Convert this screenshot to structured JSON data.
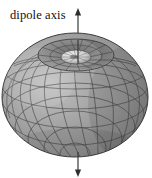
{
  "figure": {
    "title_label": "dipole axis",
    "background_color": "#ffffff",
    "axis": {
      "name": "dipole-axis",
      "color": "#3a3a3a",
      "x": 78,
      "top_y": 10,
      "bottom_y": 176,
      "arrow_up": "▲",
      "arrow_down": "▼",
      "line_width": 1.2
    },
    "surface": {
      "name": "dipole-radiation-pattern",
      "description": "toroidal dipole radiation pattern rendered as a shaded wireframe sphere with a funnel-shaped dimple at the top pole",
      "center_x": 75,
      "center_y": 97,
      "radius_x": 73,
      "radius_y": 62,
      "top_y": 33,
      "bottom_y": 157,
      "left_x": 2,
      "right_x": 148,
      "fill_light": "#b4b4b4",
      "fill_mid": "#9a9a9a",
      "fill_dark": "#7d7d7d",
      "fill_darkest": "#6a6a6a",
      "mesh_color": "#4a4a4a",
      "mesh_width": 0.7,
      "outline_color": "#3d3d3d",
      "meridian_count": 16,
      "parallel_count": 9,
      "dimple": {
        "name": "top-pole-dimple",
        "center_x": 76,
        "center_y": 55,
        "outer_rx": 38,
        "outer_ry": 16,
        "inner_rx": 15,
        "inner_ry": 7,
        "inner_fill": "#dedede",
        "shadow_fill": "#6f6f6f"
      }
    }
  }
}
